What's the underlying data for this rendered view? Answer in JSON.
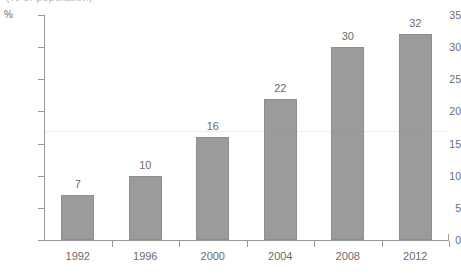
{
  "figure": {
    "cut_off_title": "(% of population)",
    "background_color": "#ffffff",
    "bar_color": "#9b9b9b",
    "bar_outline_color": "#8e8e8e",
    "text_color": "#6b6b6b",
    "axis_color": "#9a9a9a"
  },
  "chart_data": {
    "type": "bar",
    "title": "",
    "xlabel": "",
    "ylabel": "%",
    "categories": [
      "1992",
      "1996",
      "2000",
      "2004",
      "2008",
      "2012"
    ],
    "values": [
      7,
      10,
      16,
      22,
      30,
      32
    ],
    "data_labels": [
      "7",
      "10",
      "16",
      "22",
      "30",
      "32"
    ],
    "ylim": [
      0,
      35
    ],
    "ytick_values": [
      0,
      5,
      10,
      15,
      20,
      25,
      30,
      35
    ],
    "ytick_labels": [
      "0",
      "5",
      "10",
      "15",
      "20",
      "25",
      "30",
      "35"
    ],
    "grid": false,
    "legend": null,
    "orientation": "vertical"
  }
}
